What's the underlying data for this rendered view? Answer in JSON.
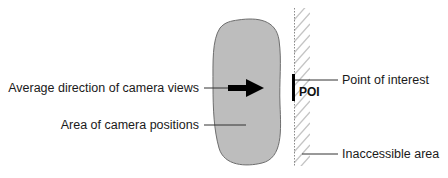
{
  "diagram": {
    "labels": {
      "average_direction": "Average direction of camera views",
      "area_positions": "Area of camera positions",
      "point_of_interest": "Point of interest",
      "poi_tag": "POI",
      "inaccessible": "Inaccessible area"
    },
    "colors": {
      "blob_fill": "#bdbdbd",
      "blob_stroke": "#6e6e6e",
      "arrow": "#000000",
      "leader_line": "#333333",
      "hatch": "#bdbdbd",
      "wall_line": "#8a8a8a",
      "text": "#1a1a1a"
    }
  }
}
